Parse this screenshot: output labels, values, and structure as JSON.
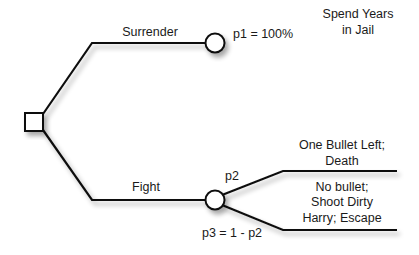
{
  "diagram": {
    "type": "decision-tree",
    "decision_node": {
      "shape": "square"
    },
    "branches": {
      "surrender": {
        "label": "Surrender",
        "chance_node": {
          "shape": "circle",
          "probability_label": "p1 = 100%"
        },
        "outcome": {
          "line1": "Spend Years",
          "line2": "in Jail"
        }
      },
      "fight": {
        "label": "Fight",
        "chance_node": {
          "shape": "circle"
        },
        "outcomes": [
          {
            "probability_label": "p2",
            "line1": "One Bullet Left;",
            "line2": "Death"
          },
          {
            "probability_label": "p3 = 1 - p2",
            "line1": "No bullet;",
            "line2": "Shoot Dirty",
            "line3": "Harry; Escape"
          }
        ]
      }
    },
    "colors": {
      "line": "#111111",
      "text": "#1a1a1a",
      "background": "#ffffff"
    }
  }
}
